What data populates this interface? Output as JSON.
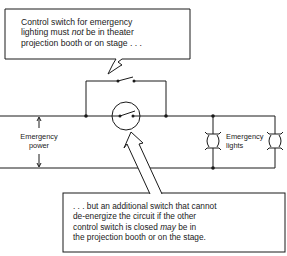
{
  "diagram": {
    "top_callout": {
      "line1": "Control switch for emergency",
      "line2_pre": "lighting must ",
      "line2_em": "not",
      "line2_post": " be in theater",
      "line3": "projection booth or on stage . . ."
    },
    "bottom_callout": {
      "line1": ". . . but an additional switch that cannot",
      "line2": "de-energize the circuit if the other",
      "line3_pre": "control switch is closed ",
      "line3_em": "may",
      "line3_post": " be in",
      "line4": "the projection booth or on the stage."
    },
    "labels": {
      "power_line1": "Emergency",
      "power_line2": "power",
      "lights_line1": "Emergency",
      "lights_line2": "lights"
    },
    "components": [
      {
        "type": "switch",
        "role": "control-switch",
        "position": "bypass-top"
      },
      {
        "type": "switch",
        "role": "additional-switch",
        "position": "main-line-circled"
      },
      {
        "type": "lamp",
        "role": "emergency-light",
        "count": 2
      }
    ],
    "colors": {
      "line": "#1a1a1a",
      "background": "#ffffff"
    }
  }
}
